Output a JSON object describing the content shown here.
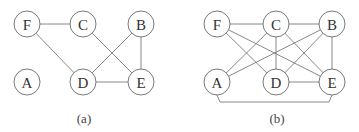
{
  "graphs": [
    {
      "id": "a",
      "caption": "(a)",
      "caption_pos": [
        84,
        118
      ],
      "node_radius": 13,
      "nodes": [
        {
          "label": "F",
          "x": 27,
          "y": 24
        },
        {
          "label": "C",
          "x": 83,
          "y": 24
        },
        {
          "label": "B",
          "x": 141,
          "y": 24
        },
        {
          "label": "A",
          "x": 27,
          "y": 82
        },
        {
          "label": "D",
          "x": 83,
          "y": 82
        },
        {
          "label": "E",
          "x": 141,
          "y": 82
        }
      ],
      "edges": [
        [
          "F",
          "C"
        ],
        [
          "F",
          "D"
        ],
        [
          "C",
          "E"
        ],
        [
          "B",
          "D"
        ],
        [
          "B",
          "E"
        ],
        [
          "D",
          "E"
        ]
      ],
      "bracket_edges": []
    },
    {
      "id": "b",
      "caption": "(b)",
      "caption_pos": [
        277,
        118
      ],
      "node_radius": 13,
      "nodes": [
        {
          "label": "F",
          "x": 217,
          "y": 24
        },
        {
          "label": "C",
          "x": 276,
          "y": 24
        },
        {
          "label": "B",
          "x": 332,
          "y": 24
        },
        {
          "label": "A",
          "x": 217,
          "y": 82
        },
        {
          "label": "D",
          "x": 276,
          "y": 82
        },
        {
          "label": "E",
          "x": 332,
          "y": 82
        }
      ],
      "edges": [
        [
          "F",
          "C"
        ],
        [
          "C",
          "B"
        ],
        [
          "F",
          "D"
        ],
        [
          "F",
          "E"
        ],
        [
          "C",
          "A"
        ],
        [
          "C",
          "D"
        ],
        [
          "C",
          "E"
        ],
        [
          "B",
          "A"
        ],
        [
          "B",
          "D"
        ],
        [
          "B",
          "E"
        ],
        [
          "D",
          "E"
        ]
      ],
      "bracket_edges": [
        {
          "from": "A",
          "to": "E",
          "y": 102
        }
      ]
    }
  ],
  "colors": {
    "edge": "#7a7a7a",
    "node_stroke": "#6a6a6a",
    "label": "#333333",
    "background": "#ffffff"
  }
}
